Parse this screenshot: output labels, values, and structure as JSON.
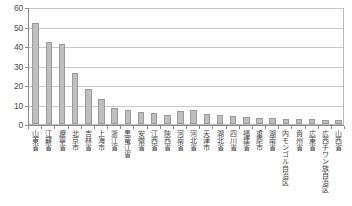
{
  "chart_data": {
    "type": "bar",
    "title": "",
    "subtitle": "",
    "xlabel": "",
    "ylabel": "",
    "ylim": [
      0,
      60
    ],
    "yticks": [
      0,
      10,
      20,
      30,
      40,
      50,
      60
    ],
    "grid": true,
    "legend": false,
    "bar_color": "#bfbfbf",
    "bar_border_color": "#9a9a9a",
    "axis_color": "#8a8a8a",
    "gridline_color": "#c9c9c9",
    "categories": [
      "山東省",
      "江蘇省",
      "遼寧省",
      "北京市",
      "吉林省",
      "上海市",
      "浙江省",
      "黒竜江省",
      "安徽省",
      "江西省",
      "陝西省",
      "河南省",
      "河北省",
      "天津市",
      "湖北省",
      "四川省",
      "福建省",
      "重慶市",
      "湖南省",
      "内モンゴル自治区",
      "貴州省",
      "広東省",
      "広西チワン族自治区",
      "山西省"
    ],
    "values": [
      52,
      42,
      41,
      26,
      18,
      13,
      8,
      7,
      6,
      5.5,
      4.5,
      6.5,
      7,
      5,
      4.5,
      4,
      3.5,
      3,
      3,
      2.5,
      2.5,
      2.5,
      2,
      2
    ]
  }
}
